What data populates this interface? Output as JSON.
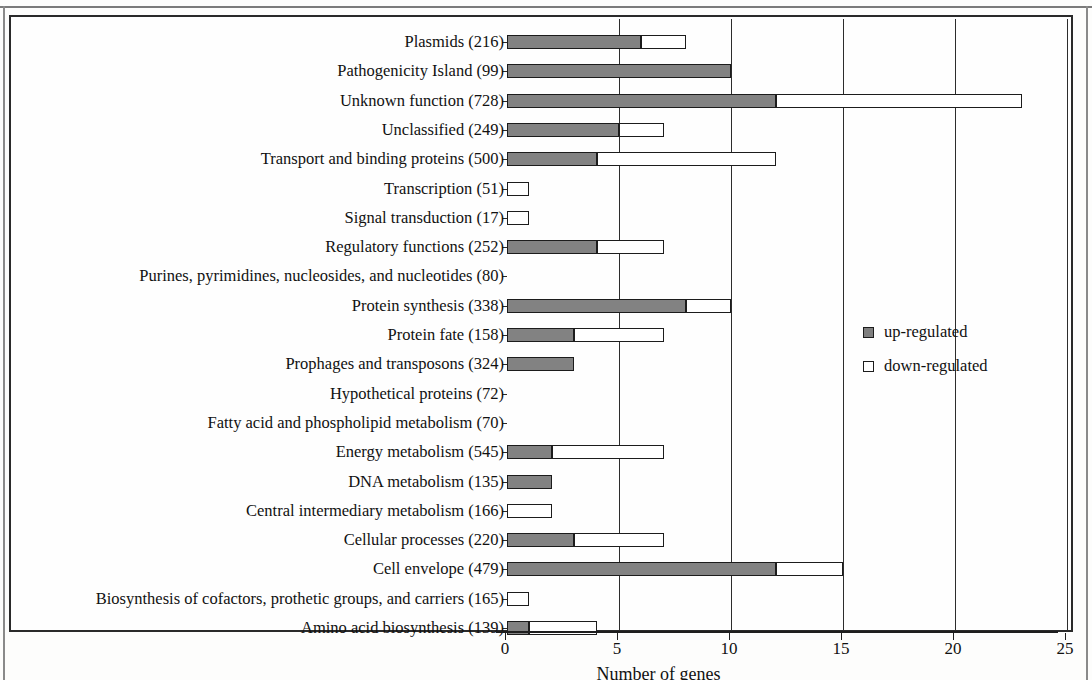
{
  "chart_data": {
    "type": "bar",
    "orientation": "horizontal",
    "stacked": false,
    "title": "",
    "xlabel": "Number of genes",
    "ylabel": "",
    "xlim": [
      0,
      25
    ],
    "xticks": [
      0,
      5,
      10,
      15,
      20,
      25
    ],
    "grid": "vertical",
    "legend_position": "right-middle",
    "legend": [
      {
        "key": "up",
        "label": "up-regulated",
        "color": "#7f7f7f"
      },
      {
        "key": "down",
        "label": "down-regulated",
        "color": "#ffffff"
      }
    ],
    "categories": [
      "Plasmids (216)",
      "Pathogenicity Island (99)",
      "Unknown function (728)",
      "Unclassified (249)",
      "Transport and binding proteins (500)",
      "Transcription (51)",
      "Signal transduction (17)",
      "Regulatory functions (252)",
      "Purines, pyrimidines, nucleosides, and nucleotides (80)",
      "Protein synthesis (338)",
      "Protein fate (158)",
      "Prophages and transposons (324)",
      "Hypothetical proteins (72)",
      "Fatty acid and phospholipid metabolism (70)",
      "Energy metabolism (545)",
      "DNA metabolism (135)",
      "Central intermediary metabolism (166)",
      "Cellular processes (220)",
      "Cell envelope (479)",
      "Biosynthesis of cofactors, prothetic groups, and carriers (165)",
      "Amino acid biosynthesis (139)"
    ],
    "series": [
      {
        "name": "up-regulated",
        "values": [
          6,
          10,
          12,
          5,
          4,
          0,
          0,
          4,
          0,
          8,
          3,
          3,
          0,
          0,
          2,
          2,
          0,
          3,
          12,
          0,
          1
        ]
      },
      {
        "name": "down-regulated",
        "values": [
          2,
          0,
          11,
          2,
          8,
          1,
          1,
          3,
          0,
          2,
          4,
          0,
          0,
          0,
          5,
          0,
          2,
          4,
          3,
          1,
          3
        ]
      }
    ],
    "totals": [
      8,
      10,
      23,
      7,
      12,
      1,
      1,
      7,
      0,
      10,
      7,
      3,
      0,
      0,
      7,
      2,
      2,
      7,
      15,
      1,
      4
    ]
  }
}
